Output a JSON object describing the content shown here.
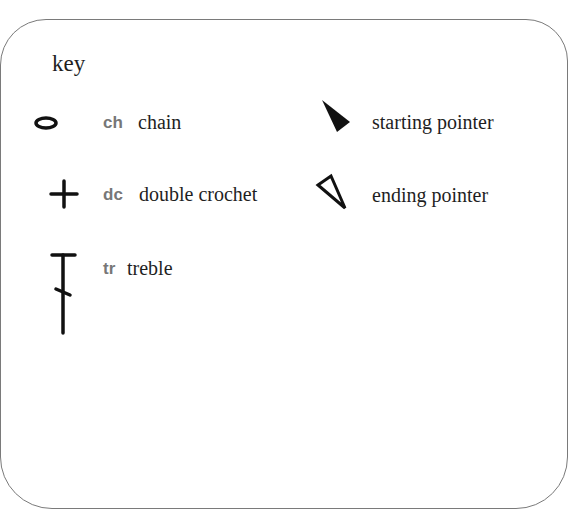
{
  "key": {
    "title": "key",
    "border_color": "#7a7a7a",
    "entries": [
      {
        "symbol": "chain-oval-icon",
        "abbr": "ch",
        "label": "chain"
      },
      {
        "symbol": "double-crochet-plus-icon",
        "abbr": "dc",
        "label": "double crochet"
      },
      {
        "symbol": "treble-stitch-icon",
        "abbr": "tr",
        "label": "treble"
      },
      {
        "symbol": "starting-pointer-icon",
        "abbr": "",
        "label": "starting pointer"
      },
      {
        "symbol": "ending-pointer-icon",
        "abbr": "",
        "label": "ending pointer"
      }
    ],
    "colors": {
      "symbol": "#111111",
      "abbr": "#777777",
      "text": "#1f1f1f"
    }
  }
}
